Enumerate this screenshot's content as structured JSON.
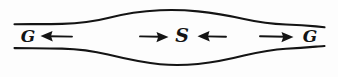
{
  "figure": {
    "background_color": "#fdfdfd",
    "ink_color": "#141414",
    "width": 338,
    "height": 77
  },
  "labels": {
    "left": "G",
    "center": "S",
    "right": "G"
  },
  "arrows": [
    {
      "name": "arrow-left-outward",
      "direction": "left",
      "points_to": "G"
    },
    {
      "name": "arrow-center-left-inward",
      "direction": "right",
      "points_to": "S"
    },
    {
      "name": "arrow-center-right-inward",
      "direction": "left",
      "points_to": "S"
    },
    {
      "name": "arrow-right-outward",
      "direction": "right",
      "points_to": "G"
    }
  ],
  "chart_data": {
    "type": "line",
    "xlabel": "",
    "ylabel": "",
    "xlim": [
      0,
      338
    ],
    "ylim": [
      0,
      77
    ],
    "grid": false,
    "legend": "none",
    "series": [
      {
        "name": "upper-boundary",
        "x": [
          14,
          40,
          70,
          100,
          130,
          160,
          178,
          200,
          230,
          260,
          290,
          312,
          324
        ],
        "y": [
          24,
          24,
          23,
          20,
          15,
          11,
          10,
          11,
          15,
          20,
          24,
          26,
          27
        ]
      },
      {
        "name": "lower-boundary",
        "x": [
          14,
          40,
          70,
          100,
          130,
          160,
          178,
          200,
          230,
          260,
          290,
          312,
          324
        ],
        "y": [
          48,
          48,
          49,
          53,
          59,
          64,
          65,
          64,
          60,
          54,
          49,
          47,
          46
        ]
      }
    ],
    "annotations": [
      {
        "text": "G",
        "x": 28,
        "y": 38
      },
      {
        "text": "S",
        "x": 182,
        "y": 37
      },
      {
        "text": "G",
        "x": 310,
        "y": 38
      },
      {
        "text": "←",
        "x": 58,
        "y": 38
      },
      {
        "text": "→",
        "x": 157,
        "y": 38
      },
      {
        "text": "←",
        "x": 208,
        "y": 38
      },
      {
        "text": "→",
        "x": 277,
        "y": 38
      }
    ]
  }
}
